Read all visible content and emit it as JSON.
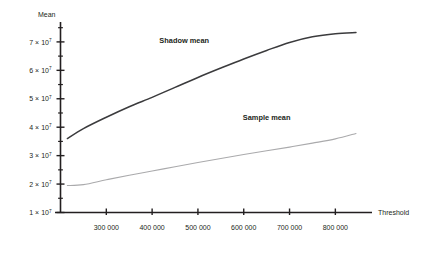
{
  "chart_data": {
    "type": "line",
    "title": "",
    "xlabel": "Threshold",
    "ylabel": "Mean",
    "grid": false,
    "legend_position": "inline-annotation",
    "xlim": [
      200000,
      880000
    ],
    "ylim": [
      10000000,
      77000000
    ],
    "xticks": [
      300000,
      400000,
      500000,
      600000,
      700000,
      800000
    ],
    "xtick_labels": [
      "300 000",
      "400 000",
      "500 000",
      "600 000",
      "700 000",
      "800 000"
    ],
    "yticks": [
      10000000,
      20000000,
      30000000,
      40000000,
      50000000,
      60000000,
      70000000
    ],
    "ytick_labels": [
      {
        "mantissa": "1 × 10",
        "exponent": "7"
      },
      {
        "mantissa": "2 × 10",
        "exponent": "7"
      },
      {
        "mantissa": "3 × 10",
        "exponent": "7"
      },
      {
        "mantissa": "4 × 10",
        "exponent": "7"
      },
      {
        "mantissa": "5 × 10",
        "exponent": "7"
      },
      {
        "mantissa": "6 × 10",
        "exponent": "7"
      },
      {
        "mantissa": "7 × 10",
        "exponent": "7"
      }
    ],
    "series": [
      {
        "name": "Shadow mean",
        "color": "#3b3b3d",
        "x": [
          215000,
          250000,
          300000,
          350000,
          400000,
          450000,
          500000,
          550000,
          600000,
          650000,
          700000,
          750000,
          800000,
          845000
        ],
        "values": [
          36000000,
          39500000,
          43500000,
          47200000,
          50500000,
          54000000,
          57500000,
          60800000,
          64000000,
          67000000,
          69800000,
          71800000,
          72900000,
          73300000
        ]
      },
      {
        "name": "Sample mean",
        "color": "#aaaaac",
        "x": [
          215000,
          250000,
          300000,
          350000,
          400000,
          450000,
          500000,
          550000,
          600000,
          650000,
          700000,
          750000,
          800000,
          845000
        ],
        "values": [
          19500000,
          19800000,
          21500000,
          23100000,
          24600000,
          26100000,
          27600000,
          29000000,
          30400000,
          31700000,
          33000000,
          34400000,
          35900000,
          37800000
        ]
      }
    ],
    "annotations": [
      {
        "text": "Shadow mean",
        "x": 470000,
        "y": 69500000
      },
      {
        "text": "Sample mean",
        "x": 650000,
        "y": 42500000
      }
    ]
  },
  "axis": {
    "y_title": "Mean",
    "x_title": "Threshold"
  },
  "colors": {
    "axis": "#231f20",
    "shadow_mean": "#3b3b3d",
    "sample_mean": "#aaaaac",
    "background": "#ffffff"
  }
}
